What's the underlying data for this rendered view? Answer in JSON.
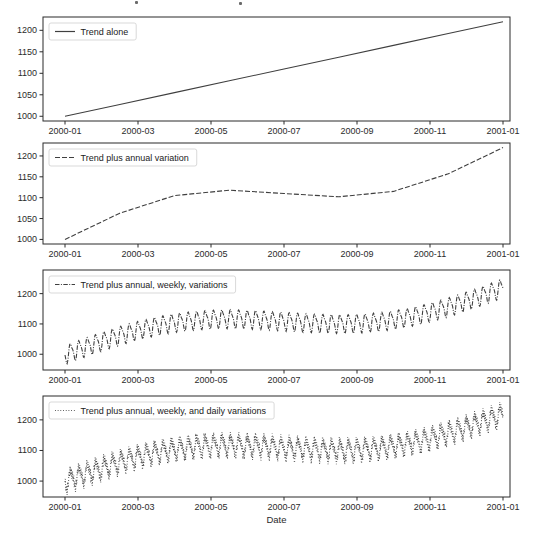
{
  "figure": {
    "xlabel": "Date",
    "background_color": "#ffffff",
    "axis_color": "#2b2b2b",
    "line_color": "#3f3f3f",
    "x_tick_labels": [
      "2000-01",
      "2000-03",
      "2000-05",
      "2000-07",
      "2000-09",
      "2000-11",
      "2001-01"
    ],
    "x_range": [
      "2000-01",
      "2001-01"
    ]
  },
  "chart_data": [
    {
      "type": "line",
      "legend": "Trend alone",
      "linestyle": "solid",
      "y_ticks": [
        1000,
        1050,
        1100,
        1150,
        1200
      ],
      "ylim": [
        989,
        1231
      ],
      "x_monthly": [
        "2000-01",
        "2000-02",
        "2000-03",
        "2000-04",
        "2000-05",
        "2000-06",
        "2000-07",
        "2000-08",
        "2000-09",
        "2000-10",
        "2000-11",
        "2000-12",
        "2001-01"
      ],
      "monthly_values": [
        1000,
        1018,
        1037,
        1055,
        1073,
        1092,
        1110,
        1128,
        1147,
        1165,
        1183,
        1202,
        1220
      ],
      "series_model": {
        "base": 1000,
        "slope_per_year": 220,
        "components": []
      }
    },
    {
      "type": "line",
      "legend": "Trend plus annual variation",
      "linestyle": "dashed",
      "y_ticks": [
        1000,
        1050,
        1100,
        1150,
        1200
      ],
      "ylim": [
        989,
        1231
      ],
      "x_monthly": [
        "2000-01",
        "2000-02",
        "2000-03",
        "2000-04",
        "2000-05",
        "2000-06",
        "2000-07",
        "2000-08",
        "2000-09",
        "2000-10",
        "2000-11",
        "2000-12",
        "2001-01"
      ],
      "monthly_values": [
        1000,
        1043,
        1080,
        1105,
        1117,
        1117,
        1110,
        1103,
        1103,
        1115,
        1140,
        1177,
        1220
      ],
      "series_model": {
        "base": 1000,
        "slope_per_year": 220,
        "components": [
          {
            "amp": 50,
            "freq": 1,
            "phase": 0
          }
        ]
      }
    },
    {
      "type": "line",
      "legend": "Trend plus annual, weekly, variations",
      "linestyle": "dashdot",
      "y_ticks": [
        1000,
        1100,
        1200
      ],
      "ylim": [
        948,
        1278
      ],
      "x_monthly": [
        "2000-01",
        "2000-02",
        "2000-03",
        "2000-04",
        "2000-05",
        "2000-06",
        "2000-07",
        "2000-08",
        "2000-09",
        "2000-10",
        "2000-11",
        "2000-12",
        "2001-01"
      ],
      "monthly_mean_values": [
        1000,
        1043,
        1080,
        1105,
        1117,
        1117,
        1110,
        1103,
        1103,
        1115,
        1140,
        1177,
        1220
      ],
      "weekly_oscillation_range": 36,
      "series_model": {
        "base": 1000,
        "slope_per_year": 220,
        "components": [
          {
            "amp": 50,
            "freq": 1,
            "phase": 0
          },
          {
            "amp": 28,
            "freq": 52,
            "phase": 3.5
          },
          {
            "amp": 8,
            "freq": 104,
            "phase": 1.2
          }
        ]
      }
    },
    {
      "type": "line",
      "legend": "Trend plus annual, weekly, and daily variations",
      "linestyle": "dotted",
      "y_ticks": [
        1000,
        1100,
        1200
      ],
      "ylim": [
        948,
        1278
      ],
      "x_monthly": [
        "2000-01",
        "2000-02",
        "2000-03",
        "2000-04",
        "2000-05",
        "2000-06",
        "2000-07",
        "2000-08",
        "2000-09",
        "2000-10",
        "2000-11",
        "2000-12",
        "2001-01"
      ],
      "monthly_mean_values": [
        1000,
        1043,
        1080,
        1105,
        1117,
        1117,
        1110,
        1103,
        1103,
        1115,
        1140,
        1177,
        1220
      ],
      "weekly_oscillation_range": 36,
      "daily_oscillation_range": 14,
      "series_model": {
        "base": 1000,
        "slope_per_year": 220,
        "components": [
          {
            "amp": 50,
            "freq": 1,
            "phase": 0
          },
          {
            "amp": 28,
            "freq": 52,
            "phase": 3.5
          },
          {
            "amp": 8,
            "freq": 104,
            "phase": 1.2
          },
          {
            "amp": 14,
            "freq": 366,
            "phase": 0
          }
        ]
      }
    }
  ]
}
